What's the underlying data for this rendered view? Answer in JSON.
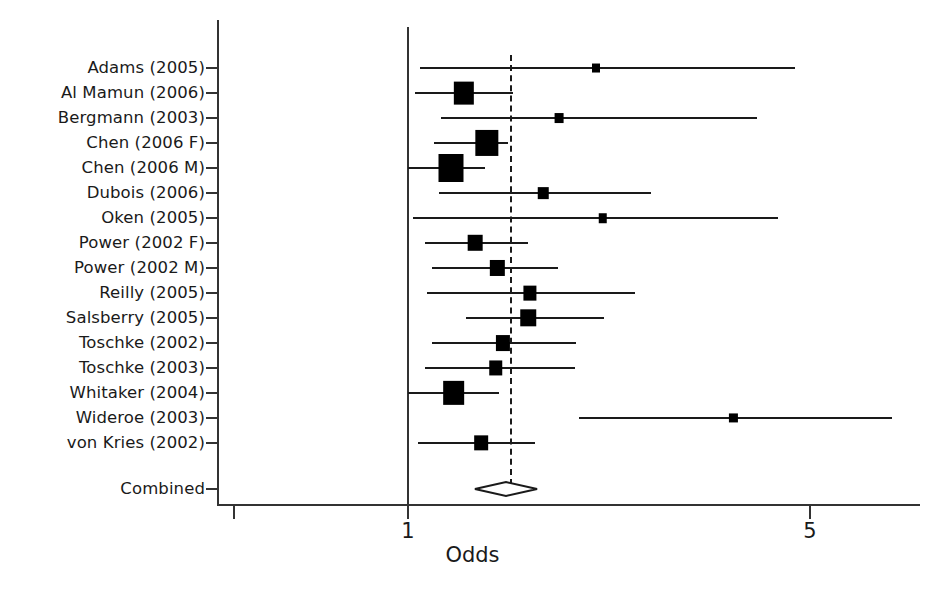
{
  "chart_data": {
    "type": "forest",
    "title": "",
    "xlabel": "Odds",
    "ylabel": "",
    "xscale": "log",
    "xticks": [
      1,
      5
    ],
    "xtick_labels": [
      "1",
      "5"
    ],
    "xlim": [
      0.62,
      7.2
    ],
    "null_value": 1,
    "pooled_value": 1.48,
    "grid": false,
    "legend": "none",
    "categories": [
      "Adams (2005)",
      "Al Mamun (2006)",
      "Bergmann (2003)",
      "Chen (2006 F)",
      "Chen (2006 M)",
      "Dubois (2006)",
      "Oken (2005)",
      "Power (2002 F)",
      "Power (2002 M)",
      "Reilly (2005)",
      "Salsberry (2005)",
      "Toschke (2002)",
      "Toschke (2003)",
      "Whitaker (2004)",
      "Wideroe (2003)",
      "von Kries (2002)"
    ],
    "studies": [
      {
        "label": "Adams (2005)",
        "odds": 2.12,
        "ci_low": 1.05,
        "ci_high": 4.7,
        "weight": 0.08
      },
      {
        "label": "Al Mamun (2006)",
        "odds": 1.25,
        "ci_low": 1.03,
        "ci_high": 1.52,
        "weight": 0.82
      },
      {
        "label": "Bergmann (2003)",
        "odds": 1.83,
        "ci_low": 1.14,
        "ci_high": 4.05,
        "weight": 0.13
      },
      {
        "label": "Chen (2006 F)",
        "odds": 1.37,
        "ci_low": 1.11,
        "ci_high": 1.49,
        "weight": 1.0
      },
      {
        "label": "Chen (2006 M)",
        "odds": 1.19,
        "ci_low": 1.0,
        "ci_high": 1.36,
        "weight": 1.1
      },
      {
        "label": "Dubois (2006)",
        "odds": 1.72,
        "ci_low": 1.13,
        "ci_high": 2.65,
        "weight": 0.23
      },
      {
        "label": "Oken (2005)",
        "odds": 2.18,
        "ci_low": 1.02,
        "ci_high": 4.4,
        "weight": 0.11
      },
      {
        "label": "Power (2002 F)",
        "odds": 1.31,
        "ci_low": 1.07,
        "ci_high": 1.62,
        "weight": 0.48
      },
      {
        "label": "Power (2002 M)",
        "odds": 1.43,
        "ci_low": 1.1,
        "ci_high": 1.82,
        "weight": 0.46
      },
      {
        "label": "Reilly (2005)",
        "odds": 1.63,
        "ci_low": 1.08,
        "ci_high": 2.48,
        "weight": 0.39
      },
      {
        "label": "Salsberry (2005)",
        "odds": 1.62,
        "ci_low": 1.26,
        "ci_high": 2.19,
        "weight": 0.53
      },
      {
        "label": "Toschke (2002)",
        "odds": 1.46,
        "ci_low": 1.1,
        "ci_high": 1.96,
        "weight": 0.45
      },
      {
        "label": "Toschke (2003)",
        "odds": 1.42,
        "ci_low": 1.07,
        "ci_high": 1.95,
        "weight": 0.41
      },
      {
        "label": "Whitaker (2004)",
        "odds": 1.2,
        "ci_low": 1.0,
        "ci_high": 1.44,
        "weight": 0.9
      },
      {
        "label": "Wideroe (2003)",
        "odds": 3.68,
        "ci_low": 1.98,
        "ci_high": 6.95,
        "weight": 0.09
      },
      {
        "label": "von Kries (2002)",
        "odds": 1.34,
        "ci_low": 1.04,
        "ci_high": 1.66,
        "weight": 0.42
      }
    ],
    "combined": {
      "label": "Combined",
      "odds": 1.48,
      "ci_low": 1.36,
      "ci_high": 1.61
    }
  },
  "axis": {
    "x_title": "Odds",
    "tick_labels": [
      "1",
      "5"
    ]
  }
}
